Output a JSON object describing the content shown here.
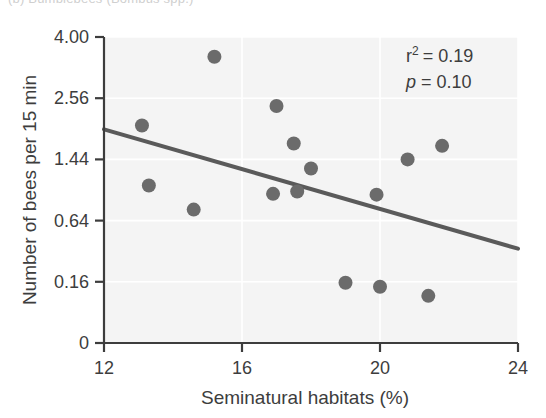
{
  "figure": {
    "cut_off_caption": "(b)  Bumblebees (Bombus spp.)",
    "background_color": "#ffffff",
    "plot_background_color": "#f4f4f4",
    "point_color": "#6b6b6b",
    "line_color": "#5a5a5a",
    "axis_color": "#3d3d3d",
    "grid_color": "#ffffff"
  },
  "annotations": {
    "r_squared_prefix": "r",
    "r_squared_sup": "2",
    "r_squared_value": "= 0.19",
    "p_prefix": "p",
    "p_value": "= 0.10"
  },
  "chart_data": {
    "type": "scatter",
    "title": "",
    "xlabel": "Seminatural habitats (%)",
    "ylabel": "Number of bees per 15 min",
    "xlim": [
      12,
      24
    ],
    "ylim": [
      0,
      4.0
    ],
    "yscale": "sqrt",
    "grid": true,
    "legend": null,
    "xticks": [
      12,
      16,
      20,
      24
    ],
    "xticklabels": [
      "12",
      "16",
      "20",
      "24"
    ],
    "yticks": [
      0,
      0.16,
      0.64,
      1.44,
      2.56,
      4.0
    ],
    "yticklabels": [
      "0",
      "0.16",
      "0.64",
      "1.44",
      "2.56",
      "4.00"
    ],
    "points": [
      {
        "x": 13.1,
        "y": 2.02
      },
      {
        "x": 15.2,
        "y": 3.5
      },
      {
        "x": 13.3,
        "y": 1.06
      },
      {
        "x": 14.6,
        "y": 0.76
      },
      {
        "x": 17.0,
        "y": 2.4
      },
      {
        "x": 17.5,
        "y": 1.7
      },
      {
        "x": 16.9,
        "y": 0.95
      },
      {
        "x": 18.0,
        "y": 1.3
      },
      {
        "x": 17.6,
        "y": 0.98
      },
      {
        "x": 19.9,
        "y": 0.94
      },
      {
        "x": 20.8,
        "y": 1.44
      },
      {
        "x": 21.8,
        "y": 1.66
      },
      {
        "x": 19.0,
        "y": 0.155
      },
      {
        "x": 20.0,
        "y": 0.135
      },
      {
        "x": 21.4,
        "y": 0.095
      }
    ],
    "regression_line": {
      "x_start": 12.0,
      "y_start": 1.95,
      "x_end": 24.0,
      "y_end": 0.38,
      "r_squared": 0.19,
      "p_value": 0.1
    }
  }
}
